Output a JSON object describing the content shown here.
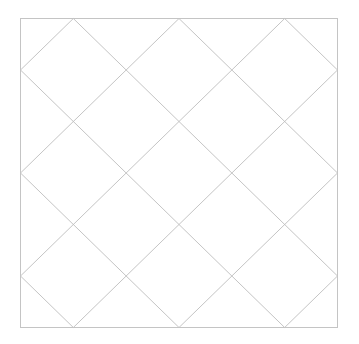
{
  "diagram": {
    "type": "diamond-lattice",
    "frame": {
      "x": 20.5,
      "y": 18.5,
      "width": 317,
      "height": 309
    },
    "divisions": 6,
    "colors": {
      "border": "#c4c4c4",
      "lines": "#bdbdbd",
      "background": "#ffffff"
    },
    "down_diagonals": [
      -5,
      -3,
      -1,
      1,
      3,
      5
    ],
    "up_diagonals": [
      1,
      3,
      5,
      7,
      9,
      11
    ]
  }
}
